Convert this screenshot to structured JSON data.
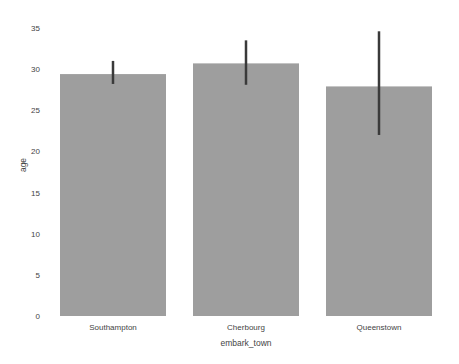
{
  "chart_data": {
    "type": "bar",
    "title": "",
    "xlabel": "embark_town",
    "ylabel": "age",
    "categories": [
      "Southampton",
      "Cherbourg",
      "Queenstown"
    ],
    "values": [
      29.4,
      30.7,
      27.9
    ],
    "error_bars": [
      {
        "low": 28.2,
        "high": 31.0
      },
      {
        "low": 28.1,
        "high": 33.5
      },
      {
        "low": 22.0,
        "high": 34.6
      }
    ],
    "ylim": [
      0,
      35
    ],
    "yticks": [
      0,
      5,
      10,
      15,
      20,
      25,
      30,
      35
    ],
    "grid": false,
    "legend": null,
    "colors": {
      "bar": "#9e9e9e",
      "error_bar": "#3a3a3a",
      "tick_text": "#444444"
    }
  }
}
